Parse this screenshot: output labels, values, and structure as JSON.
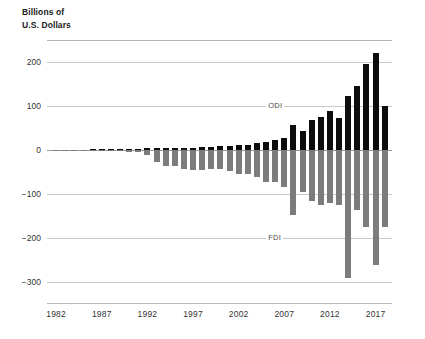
{
  "chart_data": {
    "type": "bar",
    "title": "",
    "subtitle": "",
    "ylabel_lines": [
      "Billions of",
      "U.S. Dollars"
    ],
    "xlabel": "",
    "ylim": [
      -340,
      250
    ],
    "grid": true,
    "grid_values": [
      200,
      100,
      0,
      -100,
      -200,
      -300
    ],
    "ytick_labels": [
      "200",
      "100",
      "0",
      "−100",
      "−200",
      "−300"
    ],
    "ytick_values": [
      200,
      100,
      0,
      -100,
      -200,
      -300
    ],
    "xtick_labels": [
      "1982",
      "1987",
      "1992",
      "1997",
      "2002",
      "2007",
      "2012",
      "2017"
    ],
    "xtick_values": [
      1982,
      1987,
      1992,
      1997,
      2002,
      2007,
      2012,
      2017
    ],
    "legend_position": "inline-annotation",
    "annotations": [
      {
        "text": "ODI",
        "x": 2006,
        "y": 100
      },
      {
        "text": "FDI",
        "x": 2006,
        "y": -200
      }
    ],
    "colors": {
      "odi": "#0d0d0d",
      "fdi": "#7c7c7c",
      "grid": "#c9c9c9",
      "axis": "#b8b8b8"
    },
    "x": [
      1982,
      1983,
      1984,
      1985,
      1986,
      1987,
      1988,
      1989,
      1990,
      1991,
      1992,
      1993,
      1994,
      1995,
      1996,
      1997,
      1998,
      1999,
      2000,
      2001,
      2002,
      2003,
      2004,
      2005,
      2006,
      2007,
      2008,
      2009,
      2010,
      2011,
      2012,
      2013,
      2014,
      2015,
      2016,
      2017,
      2018
    ],
    "series": [
      {
        "name": "ODI",
        "color": "#0d0d0d",
        "values": [
          1,
          1,
          1,
          1,
          2,
          2,
          2,
          3,
          3,
          3,
          4,
          4,
          5,
          5,
          6,
          6,
          7,
          7,
          9,
          9,
          11,
          12,
          16,
          18,
          23,
          28,
          57,
          44,
          69,
          75,
          88,
          73,
          123,
          146,
          196,
          220,
          100
        ]
      },
      {
        "name": "FDI",
        "color": "#7c7c7c",
        "values": [
          -1,
          -1,
          -1,
          -1,
          -2,
          -2,
          -2,
          -3,
          -4,
          -4,
          -11,
          -28,
          -35,
          -37,
          -42,
          -45,
          -45,
          -43,
          -42,
          -47,
          -53,
          -54,
          -61,
          -72,
          -73,
          -84,
          -148,
          -95,
          -115,
          -124,
          -121,
          -124,
          -291,
          -135,
          -174,
          -260,
          -175
        ]
      }
    ]
  }
}
